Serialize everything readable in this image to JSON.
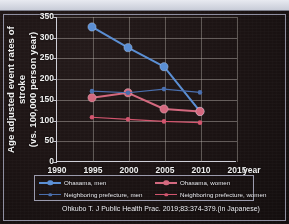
{
  "slide": {
    "top_strip_ghost_text": "‾‾‾  ‾‾‾‾‾    ‾‾‾ ‾ ‾‾‾‾‾   ‾‾‾‾"
  },
  "colors": {
    "ohasama_men": "#5b8fd4",
    "ohasama_women": "#d4697f",
    "neighboring_men": "#4a6fae",
    "neighboring_women": "#d2556e",
    "axis": "#cfcfd8",
    "grid": "#bab4af",
    "text": "#f0f0f0",
    "background": "#1b1313"
  },
  "chart_data": {
    "type": "line",
    "title": "",
    "xlabel": "year",
    "ylabel": "Age adjusted event rates of stroke (vs. 100,000 person year)",
    "ylabel_line1": "Age adjusted event rates of stroke",
    "ylabel_line2": "(vs. 100,000 person year)",
    "x": [
      1995,
      2000,
      2005,
      2010
    ],
    "xlim": [
      1990,
      2015
    ],
    "ylim": [
      0,
      350
    ],
    "xticks": [
      1990,
      1995,
      2000,
      2005,
      2010,
      2015
    ],
    "yticks": [
      0,
      50,
      100,
      150,
      200,
      250,
      300,
      350
    ],
    "grid": true,
    "legend_position": "below-axes",
    "series": [
      {
        "name": "Ohasama, men",
        "values": [
          326,
          276,
          230,
          122
        ],
        "color": "#5b8fd4",
        "marker_size": "large"
      },
      {
        "name": "Ohasama, women",
        "values": [
          155,
          167,
          128,
          122
        ],
        "color": "#d4697f",
        "marker_size": "large"
      },
      {
        "name": "Neighboring prefecture, men",
        "values": [
          171,
          167,
          176,
          168
        ],
        "color": "#4a6fae",
        "marker_size": "small"
      },
      {
        "name": "Neighboring prefecture, women",
        "values": [
          108,
          103,
          98,
          95
        ],
        "color": "#d2556e",
        "marker_size": "small"
      }
    ]
  },
  "citation": "Ohkubo T.  J Public Health Prac. 2019;83:374-379.(in Japanese)"
}
